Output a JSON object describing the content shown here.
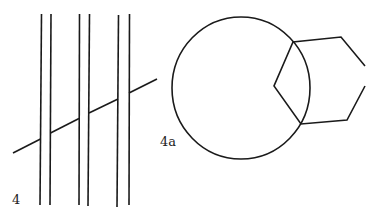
{
  "figures": [
    {
      "label": "4",
      "description": "Three pairs of parallel vertical lines crossed by an interrupted diagonal line"
    },
    {
      "label": "4a",
      "description": "Circle overlapping a hexagon-like polygon"
    }
  ],
  "colors": {
    "stroke": "#1a1a1a",
    "background": "#ffffff"
  }
}
